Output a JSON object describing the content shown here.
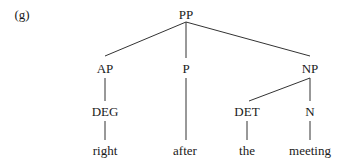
{
  "example_label": "(g)",
  "tree": {
    "nodes": {
      "pp": {
        "label": "PP",
        "x": 186,
        "y": 14
      },
      "ap": {
        "label": "AP",
        "x": 105,
        "y": 68
      },
      "p": {
        "label": "P",
        "x": 186,
        "y": 68
      },
      "np": {
        "label": "NP",
        "x": 310,
        "y": 68
      },
      "deg": {
        "label": "DEG",
        "x": 105,
        "y": 111
      },
      "det": {
        "label": "DET",
        "x": 247,
        "y": 111
      },
      "n": {
        "label": "N",
        "x": 310,
        "y": 111
      }
    },
    "leaves": {
      "right": {
        "label": "right",
        "x": 105,
        "y": 150
      },
      "after": {
        "label": "after",
        "x": 185,
        "y": 150
      },
      "the": {
        "label": "the",
        "x": 247,
        "y": 150
      },
      "meeting": {
        "label": "meeting",
        "x": 310,
        "y": 150
      }
    },
    "edges": [
      {
        "from": "PP",
        "to": "AP"
      },
      {
        "from": "PP",
        "to": "P"
      },
      {
        "from": "PP",
        "to": "NP"
      },
      {
        "from": "AP",
        "to": "DEG"
      },
      {
        "from": "P",
        "to": "after"
      },
      {
        "from": "NP",
        "to": "DET"
      },
      {
        "from": "NP",
        "to": "N"
      },
      {
        "from": "DEG",
        "to": "right"
      },
      {
        "from": "DET",
        "to": "the"
      },
      {
        "from": "N",
        "to": "meeting"
      }
    ]
  }
}
